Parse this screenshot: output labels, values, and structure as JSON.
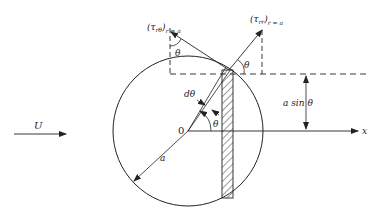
{
  "diagram": {
    "labels": {
      "tau_rtheta": "(τ",
      "tau_rtheta_sub": "rθ",
      "tau_rtheta_cond": "r = a",
      "tau_rr": "(τ",
      "tau_rr_sub": "rr",
      "tau_rr_cond": "r = a",
      "theta_top_left": "θ",
      "theta_top_right": "θ",
      "theta_center": "θ",
      "dtheta": "dθ",
      "origin": "0",
      "radius": "a",
      "a_sin_theta": "a  sin  θ",
      "free_stream": "U",
      "x_axis": "x"
    },
    "colors": {
      "stroke": "#222222",
      "background": "#ffffff"
    }
  }
}
